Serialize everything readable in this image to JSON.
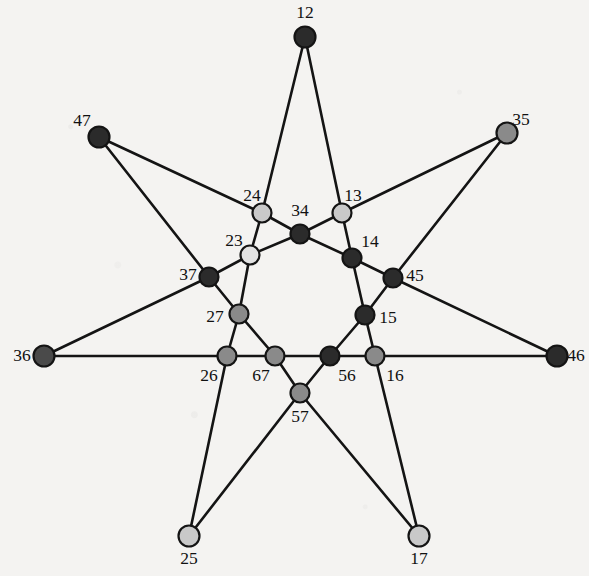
{
  "figure": {
    "title": "",
    "background_color": "#f4f3f1",
    "width": 589,
    "height": 576,
    "edge_color": "#141414",
    "label_color": "#111111"
  },
  "palette": {
    "dark": "#2b2b2b",
    "medium_dark": "#4a4a4a",
    "medium": "#8a8a8a",
    "light": "#c9c9c9",
    "outline": "#141414"
  },
  "chart_data": {
    "type": "graph",
    "title": "",
    "layout": "seven-fold symmetric star",
    "node_count": 21,
    "edge_count": 42,
    "nodes": [
      {
        "id": "12",
        "label": "12",
        "x": 305,
        "y": 37,
        "r": 10.5,
        "fill": "#2b2b2b",
        "label_x": 305,
        "label_y": 14,
        "shade": "dark"
      },
      {
        "id": "47",
        "label": "47",
        "x": 99,
        "y": 137,
        "r": 10.5,
        "fill": "#2b2b2b",
        "label_x": 82,
        "label_y": 122,
        "shade": "dark"
      },
      {
        "id": "35",
        "label": "35",
        "x": 507,
        "y": 133,
        "r": 10.5,
        "fill": "#8a8a8a",
        "label_x": 521,
        "label_y": 121,
        "shade": "medium"
      },
      {
        "id": "36",
        "label": "36",
        "x": 44,
        "y": 356,
        "r": 10.5,
        "fill": "#4a4a4a",
        "label_x": 22,
        "label_y": 357,
        "shade": "medium_dark"
      },
      {
        "id": "46",
        "label": "46",
        "x": 557,
        "y": 356,
        "r": 10.5,
        "fill": "#2b2b2b",
        "label_x": 576,
        "label_y": 357,
        "shade": "dark"
      },
      {
        "id": "25",
        "label": "25",
        "x": 189,
        "y": 536,
        "r": 10.5,
        "fill": "#c9c9c9",
        "label_x": 189,
        "label_y": 560,
        "shade": "light"
      },
      {
        "id": "17",
        "label": "17",
        "x": 419,
        "y": 536,
        "r": 10.5,
        "fill": "#c9c9c9",
        "label_x": 419,
        "label_y": 560,
        "shade": "light"
      },
      {
        "id": "24",
        "label": "24",
        "x": 262,
        "y": 213,
        "r": 9.5,
        "fill": "#c9c9c9",
        "label_x": 252,
        "label_y": 197,
        "shade": "light"
      },
      {
        "id": "13",
        "label": "13",
        "x": 342,
        "y": 213,
        "r": 9.5,
        "fill": "#c9c9c9",
        "label_x": 353,
        "label_y": 197,
        "shade": "light"
      },
      {
        "id": "34",
        "label": "34",
        "x": 300,
        "y": 234,
        "r": 9.5,
        "fill": "#2b2b2b",
        "label_x": 300,
        "label_y": 212,
        "shade": "dark"
      },
      {
        "id": "23",
        "label": "23",
        "x": 250,
        "y": 255,
        "r": 9.5,
        "fill": "#e2e2e2",
        "label_x": 234,
        "label_y": 242,
        "shade": "light"
      },
      {
        "id": "14",
        "label": "14",
        "x": 352,
        "y": 258,
        "r": 9.5,
        "fill": "#2b2b2b",
        "label_x": 370,
        "label_y": 243,
        "shade": "dark"
      },
      {
        "id": "37",
        "label": "37",
        "x": 209,
        "y": 277,
        "r": 9.5,
        "fill": "#2b2b2b",
        "label_x": 188,
        "label_y": 276,
        "shade": "dark"
      },
      {
        "id": "45",
        "label": "45",
        "x": 393,
        "y": 278,
        "r": 9.5,
        "fill": "#2b2b2b",
        "label_x": 415,
        "label_y": 277,
        "shade": "dark"
      },
      {
        "id": "27",
        "label": "27",
        "x": 239,
        "y": 314,
        "r": 9.5,
        "fill": "#8a8a8a",
        "label_x": 215,
        "label_y": 318,
        "shade": "medium"
      },
      {
        "id": "15",
        "label": "15",
        "x": 365,
        "y": 315,
        "r": 9.5,
        "fill": "#2b2b2b",
        "label_x": 388,
        "label_y": 319,
        "shade": "dark"
      },
      {
        "id": "26",
        "label": "26",
        "x": 227,
        "y": 356,
        "r": 9.5,
        "fill": "#8a8a8a",
        "label_x": 209,
        "label_y": 377,
        "shade": "medium"
      },
      {
        "id": "67",
        "label": "67",
        "x": 275,
        "y": 356,
        "r": 9.5,
        "fill": "#8a8a8a",
        "label_x": 261,
        "label_y": 377,
        "shade": "medium"
      },
      {
        "id": "56",
        "label": "56",
        "x": 330,
        "y": 356,
        "r": 9.5,
        "fill": "#2b2b2b",
        "label_x": 347,
        "label_y": 377,
        "shade": "dark"
      },
      {
        "id": "16",
        "label": "16",
        "x": 375,
        "y": 356,
        "r": 9.5,
        "fill": "#8a8a8a",
        "label_x": 395,
        "label_y": 377,
        "shade": "medium"
      },
      {
        "id": "57",
        "label": "57",
        "x": 300,
        "y": 393,
        "r": 9.5,
        "fill": "#8a8a8a",
        "label_x": 300,
        "label_y": 418,
        "shade": "medium"
      }
    ],
    "edges": [
      [
        "12",
        "24"
      ],
      [
        "12",
        "13"
      ],
      [
        "47",
        "24"
      ],
      [
        "47",
        "37"
      ],
      [
        "35",
        "13"
      ],
      [
        "35",
        "45"
      ],
      [
        "36",
        "37"
      ],
      [
        "36",
        "26"
      ],
      [
        "46",
        "45"
      ],
      [
        "46",
        "16"
      ],
      [
        "25",
        "26"
      ],
      [
        "25",
        "57"
      ],
      [
        "17",
        "57"
      ],
      [
        "17",
        "16"
      ],
      [
        "24",
        "23"
      ],
      [
        "24",
        "34"
      ],
      [
        "13",
        "34"
      ],
      [
        "13",
        "14"
      ],
      [
        "34",
        "23"
      ],
      [
        "34",
        "14"
      ],
      [
        "23",
        "37"
      ],
      [
        "23",
        "27"
      ],
      [
        "14",
        "45"
      ],
      [
        "14",
        "15"
      ],
      [
        "37",
        "27"
      ],
      [
        "45",
        "15"
      ],
      [
        "27",
        "26"
      ],
      [
        "27",
        "67"
      ],
      [
        "15",
        "56"
      ],
      [
        "15",
        "16"
      ],
      [
        "26",
        "67"
      ],
      [
        "67",
        "56"
      ],
      [
        "67",
        "57"
      ],
      [
        "56",
        "16"
      ],
      [
        "56",
        "57"
      ]
    ]
  }
}
